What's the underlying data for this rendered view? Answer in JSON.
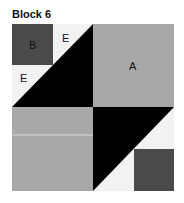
{
  "title": "Block 6",
  "labels": {
    "a": "A",
    "b": "B",
    "e1": "E",
    "e2": "E"
  },
  "colors": {
    "gray": "#a8a8a8",
    "dark": "#4a4a4a",
    "black": "#000000",
    "light": "#f2f2f2"
  }
}
